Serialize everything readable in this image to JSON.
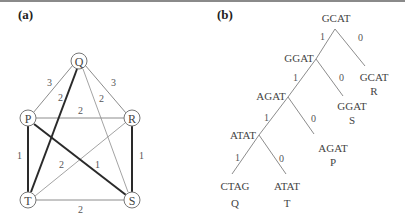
{
  "panel_a": {
    "label": "(a)",
    "nodes": {
      "Q": "Q",
      "P": "P",
      "R": "R",
      "T": "T",
      "S": "S"
    },
    "edges": {
      "QP": "3",
      "QR": "3",
      "QT": "2",
      "QS": "2",
      "PR": "2",
      "PT": "1",
      "PS": "1",
      "RS": "1",
      "RT": "2",
      "TS": "2"
    },
    "bold_edges": [
      "Q-T",
      "P-T",
      "P-S",
      "R-S"
    ]
  },
  "panel_b": {
    "label": "(b)",
    "internal_nodes": {
      "root": "GCAT",
      "n1": "GGAT",
      "n2": "AGAT",
      "n3": "ATAT"
    },
    "leaves": {
      "r_seq": "GCAT",
      "r_name": "R",
      "s_seq": "GGAT",
      "s_name": "S",
      "p_seq": "AGAT",
      "p_name": "P",
      "q_seq": "CTAG",
      "q_name": "Q",
      "t_seq": "ATAT",
      "t_name": "T"
    },
    "branch_labels": {
      "root_left": "1",
      "root_right": "0",
      "n1_left": "1",
      "n1_right": "0",
      "n2_left": "1",
      "n2_right": "0",
      "n3_left": "1",
      "n3_right": "0"
    }
  },
  "colors": {
    "thin_edge": "#8c8c8c",
    "bold_edge": "#2a2a2a",
    "node_stroke": "#777777",
    "tree_line": "#8c8c8c"
  }
}
